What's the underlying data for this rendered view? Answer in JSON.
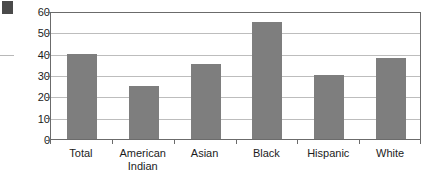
{
  "artifacts": {
    "corner_block_name": "scan-corner-block",
    "margin_rule_name": "scan-margin-rule"
  },
  "chart_data": {
    "type": "bar",
    "title": "",
    "subtitle": "",
    "xlabel": "",
    "ylabel": "",
    "categories": [
      "Total",
      "American\nIndian",
      "Asian",
      "Black",
      "Hispanic",
      "White"
    ],
    "values": [
      40,
      25,
      35,
      55,
      30,
      38
    ],
    "ylim": [
      0,
      60
    ],
    "yticks": [
      0,
      10,
      20,
      30,
      40,
      50,
      60
    ],
    "ytick_labels": [
      "0",
      "10",
      "20",
      "30",
      "40",
      "50",
      "60"
    ],
    "grid": true,
    "legend": null,
    "legend_position": "none",
    "series": [
      {
        "name": "",
        "values": [
          40,
          25,
          35,
          55,
          30,
          38
        ]
      }
    ],
    "colors": {
      "bar": "#7e7e7e",
      "gridline": "#bdbdbd",
      "axis": "#6b6b6b",
      "text": "#1c1c1c",
      "background": "#ffffff"
    }
  }
}
